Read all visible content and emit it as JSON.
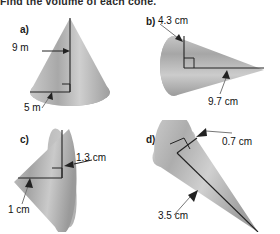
{
  "worksheet": {
    "question_text": "Find the volume of each cone.",
    "background_color": "#ffffff",
    "cone_fill_light": "#d8d8d8",
    "cone_fill_dark": "#9a9a9a",
    "line_color": "#222222"
  },
  "panels": [
    {
      "letter": "a)",
      "shape": "cone",
      "orientation": "upright",
      "unit": "m",
      "height_label": "9 m",
      "radius_label": "5 m",
      "right_angle_marker": true
    },
    {
      "letter": "b)",
      "shape": "cone",
      "orientation": "horizontal-right",
      "unit": "cm",
      "height_label": "4.3 cm",
      "radius_label": "9.7 cm",
      "right_angle_marker": true
    },
    {
      "letter": "c)",
      "shape": "cone",
      "orientation": "tilted-left",
      "unit": "cm",
      "height_label": "1.3 cm",
      "radius_label": "1 cm",
      "right_angle_marker": true
    },
    {
      "letter": "d)",
      "shape": "cone",
      "orientation": "diagonal-down-right",
      "unit": "cm",
      "height_label": "0.7 cm",
      "radius_label": "3.5 cm",
      "right_angle_marker": true
    }
  ]
}
